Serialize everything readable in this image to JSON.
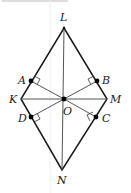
{
  "figure": {
    "type": "rhombus-kite",
    "colors": {
      "outline": "#1a1a1a",
      "inner_segments": "#555555",
      "points": "#000000"
    },
    "vertices": [
      {
        "name": "L",
        "x": 64,
        "y": 28
      },
      {
        "name": "M",
        "x": 107,
        "y": 99
      },
      {
        "name": "N",
        "x": 62,
        "y": 170
      },
      {
        "name": "K",
        "x": 21,
        "y": 99
      }
    ],
    "center": {
      "name": "O",
      "x": 64,
      "y": 99
    },
    "feet": [
      {
        "name": "A",
        "x": 31,
        "y": 81
      },
      {
        "name": "B",
        "x": 97,
        "y": 81
      },
      {
        "name": "C",
        "x": 96,
        "y": 117
      },
      {
        "name": "D",
        "x": 31,
        "y": 117
      }
    ],
    "labels": {
      "L": "L",
      "M": "M",
      "N": "N",
      "K": "K",
      "O": "O",
      "A": "A",
      "B": "B",
      "C": "C",
      "D": "D"
    }
  }
}
